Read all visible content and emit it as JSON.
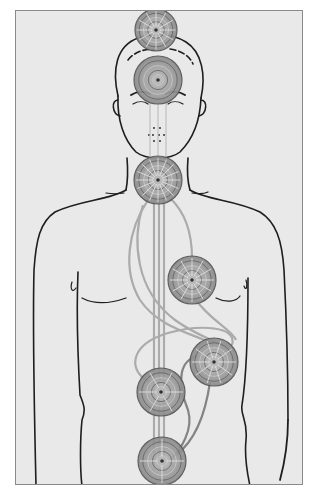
{
  "figure": {
    "description": "Line drawing of a human torso and head with seven chakra wheels aligned along the body's central channel, connected by flowing energy channels",
    "frame": {
      "border_color": "#8a8a8a",
      "background": "#e9e9e9"
    },
    "colors": {
      "outline": "#1e1e1e",
      "chakra_fill": "#9a9a9a",
      "chakra_dark": "#555555",
      "channel": "#a8a8a8"
    },
    "chakras": [
      {
        "id": "crown",
        "label": "Crown chakra",
        "cx": 156,
        "cy": 30,
        "r": 21,
        "petals": 12
      },
      {
        "id": "brow",
        "label": "Brow chakra",
        "cx": 158,
        "cy": 80,
        "r": 24,
        "petals": 0
      },
      {
        "id": "throat",
        "label": "Throat chakra",
        "cx": 158,
        "cy": 180,
        "r": 24,
        "petals": 16
      },
      {
        "id": "heart",
        "label": "Heart chakra",
        "cx": 192,
        "cy": 280,
        "r": 24,
        "petals": 12
      },
      {
        "id": "solar-plexus",
        "label": "Solar plexus chakra",
        "cx": 214,
        "cy": 362,
        "r": 24,
        "petals": 10
      },
      {
        "id": "sacral",
        "label": "Sacral chakra",
        "cx": 161,
        "cy": 392,
        "r": 24,
        "petals": 6
      },
      {
        "id": "root",
        "label": "Root chakra",
        "cx": 162,
        "cy": 461,
        "r": 24,
        "petals": 4
      }
    ]
  }
}
